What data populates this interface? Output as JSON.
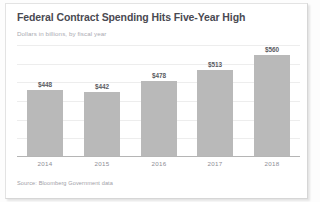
{
  "card": {
    "title": "Federal Contract Spending Hits Five-Year High",
    "subtitle": "Dollars in billions, by fiscal year",
    "source": "Source: Bloomberg Government data"
  },
  "colors": {
    "bar": "#b9b9b9",
    "title": "#4a4a52",
    "subtitle": "#a9a9b0",
    "gridline": "#ededed",
    "axis": "#b5b5b5",
    "card_background": "#ffffff"
  },
  "chart_data": {
    "type": "bar",
    "title": "Federal Contract Spending Hits Five-Year High",
    "subtitle": "Dollars in billions, by fiscal year",
    "xlabel": "",
    "ylabel": "Dollars in billions",
    "categories": [
      "2014",
      "2015",
      "2016",
      "2017",
      "2018"
    ],
    "values": [
      448,
      442,
      478,
      513,
      560
    ],
    "value_labels": [
      "$448",
      "$442",
      "$478",
      "$513",
      "$560"
    ],
    "ylim": [
      240,
      590
    ],
    "grid": true,
    "gridlines": 6,
    "legend": "none",
    "source": "Source: Bloomberg Government data"
  }
}
